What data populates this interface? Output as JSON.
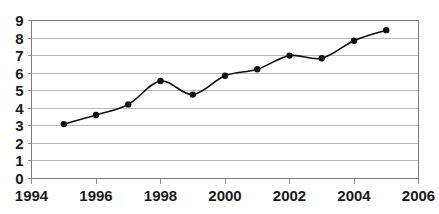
{
  "chart_data": {
    "type": "line",
    "title": "",
    "subtitle": "",
    "xlabel": "",
    "ylabel": "",
    "x": [
      1995,
      1996,
      1997,
      1998,
      1999,
      2000,
      2001,
      2002,
      2003,
      2004,
      2005
    ],
    "values": [
      3.1,
      3.62,
      4.22,
      5.55,
      4.78,
      5.85,
      6.22,
      7.0,
      6.85,
      7.85,
      8.45
    ],
    "series": [
      {
        "name": "",
        "values": [
          3.1,
          3.62,
          4.22,
          5.55,
          4.78,
          5.85,
          6.22,
          7.0,
          6.85,
          7.85,
          8.45
        ]
      }
    ],
    "xlim": [
      1994,
      2006
    ],
    "ylim": [
      0,
      9
    ],
    "x_ticks": [
      1994,
      1996,
      1998,
      2000,
      2002,
      2004,
      2006
    ],
    "x_tick_labels": [
      "1994",
      "1996",
      "1998",
      "2000",
      "2002",
      "2004",
      "2006"
    ],
    "y_ticks": [
      0,
      1,
      2,
      3,
      4,
      5,
      6,
      7,
      8,
      9
    ],
    "y_tick_labels": [
      "0",
      "1",
      "2",
      "3",
      "4",
      "5",
      "6",
      "7",
      "8",
      "9"
    ],
    "grid": "horizontal",
    "legend": "none",
    "marker": "filled-circle",
    "line_style": "smooth",
    "colors": {
      "line": "#111111",
      "marker": "#111111",
      "grid": "#b8b8b8",
      "axis": "#7a7a7a",
      "background": "#ffffff",
      "text": "#1a1a1a"
    },
    "annotations": []
  }
}
